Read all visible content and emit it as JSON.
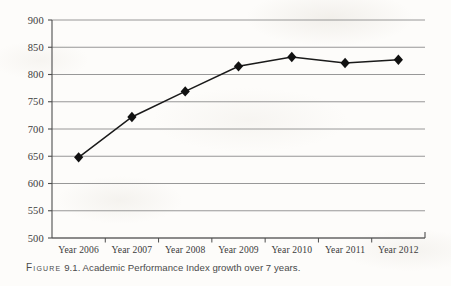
{
  "caption": {
    "figure_word": "Figure",
    "text": "9.1. Academic Performance Index growth over 7 years.",
    "full": "FIGURE 9.1. Academic Performance Index growth over 7 years."
  },
  "colors": {
    "page_background": "#fdfcfa",
    "gridline": "#8c8c8c",
    "axis": "#4d4d4d",
    "series_line": "#1a1a1a",
    "marker": "#111111",
    "tick_label": "#3b3b3b",
    "caption_text": "#4a4a4a"
  },
  "chart_data": {
    "type": "line",
    "title": "",
    "subtitle": "",
    "xlabel": "",
    "ylabel": "",
    "categories": [
      "Year 2006",
      "Year 2007",
      "Year 2008",
      "Year 2009",
      "Year 2010",
      "Year 2011",
      "Year 2012"
    ],
    "values": [
      648,
      722,
      769,
      815,
      832,
      821,
      827
    ],
    "series": [
      {
        "name": "Academic Performance Index",
        "values": [
          648,
          722,
          769,
          815,
          832,
          821,
          827
        ]
      }
    ],
    "ylim": [
      500,
      900
    ],
    "yticks": [
      500,
      550,
      600,
      650,
      700,
      750,
      800,
      850,
      900
    ],
    "ytick_labels": [
      "500",
      "550",
      "600",
      "650",
      "700",
      "750",
      "800",
      "850",
      "900"
    ],
    "grid": true,
    "grid_axis": "y",
    "legend": false,
    "legend_position": "none",
    "marker_style": "diamond",
    "annotations": []
  }
}
